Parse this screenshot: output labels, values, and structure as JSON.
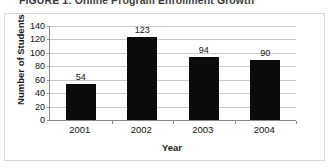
{
  "caption": {
    "text": "FIGURE 1: Online Program Enrollment Growth"
  },
  "chart_data": {
    "type": "bar",
    "title": "",
    "categories": [
      "2001",
      "2002",
      "2003",
      "2004"
    ],
    "values": [
      54,
      123,
      94,
      90
    ],
    "data_labels": [
      "54",
      "123",
      "94",
      "90"
    ],
    "xlabel": "Year",
    "ylabel": "Number of Students",
    "ylim": [
      0,
      140
    ],
    "ytick_values": [
      0,
      20,
      40,
      60,
      80,
      100,
      120,
      140
    ],
    "ytick_labels": [
      "0",
      "20",
      "40",
      "60",
      "80",
      "100",
      "120",
      "140"
    ],
    "grid": true,
    "legend": false,
    "bar_color": "#0b0b0b",
    "grid_color": "#c9c9c9",
    "axis_color": "#8a8a8a"
  }
}
